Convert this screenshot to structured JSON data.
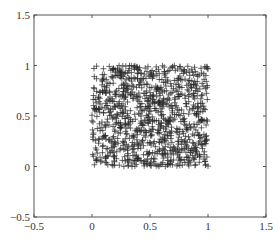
{
  "chart_data": {
    "type": "scatter",
    "title": "",
    "xlabel": "",
    "ylabel": "",
    "xlim": [
      -0.5,
      1.5
    ],
    "ylim": [
      -0.5,
      1.5
    ],
    "xticks": [
      -0.5,
      0,
      0.5,
      1,
      1.5
    ],
    "yticks": [
      -0.5,
      0,
      0.5,
      1,
      1.5
    ],
    "xtick_labels": [
      "−0.5",
      "0",
      "0.5",
      "1",
      "1.5"
    ],
    "ytick_labels": [
      "−0.5",
      "0",
      "0.5",
      "1",
      "1.5"
    ],
    "grid": false,
    "legend": null,
    "marker": "+",
    "marker_color": "#2a2a2a",
    "distribution": {
      "kind": "uniform",
      "x_range": [
        0,
        1
      ],
      "y_range": [
        0,
        1
      ],
      "count": 1000,
      "seed": 12345
    },
    "series": [
      {
        "name": "points",
        "marker": "+",
        "color": "#2a2a2a"
      }
    ]
  },
  "colors": {
    "axis": "#555555",
    "marker": "#2a2a2a",
    "background": "#ffffff"
  }
}
